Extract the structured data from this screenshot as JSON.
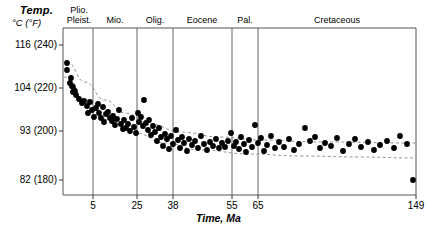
{
  "figure": {
    "y_axis_title": "Temp.",
    "y_axis_units": "°C  (°F)",
    "x_axis_title": "Time, Ma"
  },
  "chart_data": {
    "type": "scatter",
    "title": "Temp.",
    "subtitle": "°C  (°F)",
    "xlabel": "Time, Ma",
    "ylabel": "°C  (°F)",
    "grid": false,
    "legend": "none",
    "xlim": [
      0,
      149
    ],
    "ylim": [
      82,
      116
    ],
    "x_scale": "piecewise-geologic",
    "xticks": [
      {
        "value": 5,
        "label": "5",
        "px": 93
      },
      {
        "value": 25,
        "label": "25",
        "px": 137
      },
      {
        "value": 38,
        "label": "38",
        "px": 173
      },
      {
        "value": 55,
        "label": "55",
        "px": 232
      },
      {
        "value": 65,
        "label": "65",
        "px": 258
      },
      {
        "value": 149,
        "label": "149",
        "px": 416
      }
    ],
    "yticks": [
      {
        "celsius": 116,
        "fahrenheit": 240,
        "label": "116 (240)",
        "px": 45
      },
      {
        "celsius": 104,
        "fahrenheit": 220,
        "label": "104 (220)",
        "px": 88
      },
      {
        "celsius": 93,
        "fahrenheit": 200,
        "label": "93 (200)",
        "px": 131
      },
      {
        "celsius": 82,
        "fahrenheit": 180,
        "label": "82 (180)",
        "px": 180
      }
    ],
    "epochs": [
      {
        "name": "Plio.\nPleist.",
        "label_lines": [
          "Plio.",
          "Pleist."
        ],
        "x_start": 63,
        "x_end": 93,
        "center": 79
      },
      {
        "name": "Mio.",
        "label_lines": [
          "Mio."
        ],
        "x_start": 93,
        "x_end": 137,
        "center": 115
      },
      {
        "name": "Olig.",
        "label_lines": [
          "Olig."
        ],
        "x_start": 137,
        "x_end": 173,
        "center": 155
      },
      {
        "name": "Eocene",
        "label_lines": [
          "Eocene"
        ],
        "x_start": 173,
        "x_end": 232,
        "center": 202
      },
      {
        "name": "Pal.",
        "label_lines": [
          "Pal."
        ],
        "x_start": 232,
        "x_end": 258,
        "center": 245
      },
      {
        "name": "Cretaceous",
        "label_lines": [
          "Cretaceous"
        ],
        "x_start": 258,
        "x_end": 416,
        "center": 337
      }
    ],
    "points_px": [
      [
        67,
        63
      ],
      [
        67,
        70
      ],
      [
        71,
        78
      ],
      [
        70,
        83
      ],
      [
        72,
        86
      ],
      [
        73,
        87
      ],
      [
        73,
        92
      ],
      [
        75,
        91
      ],
      [
        76,
        95
      ],
      [
        79,
        99
      ],
      [
        82,
        103
      ],
      [
        84,
        101
      ],
      [
        87,
        106
      ],
      [
        88,
        113
      ],
      [
        90,
        102
      ],
      [
        92,
        110
      ],
      [
        94,
        117
      ],
      [
        96,
        108
      ],
      [
        98,
        104
      ],
      [
        99,
        113
      ],
      [
        101,
        118
      ],
      [
        103,
        107
      ],
      [
        104,
        122
      ],
      [
        106,
        114
      ],
      [
        108,
        112
      ],
      [
        110,
        118
      ],
      [
        112,
        121
      ],
      [
        113,
        116
      ],
      [
        115,
        125
      ],
      [
        117,
        119
      ],
      [
        119,
        110
      ],
      [
        121,
        124
      ],
      [
        123,
        129
      ],
      [
        124,
        120
      ],
      [
        126,
        128
      ],
      [
        128,
        124
      ],
      [
        130,
        131
      ],
      [
        132,
        118
      ],
      [
        134,
        127
      ],
      [
        136,
        133
      ],
      [
        138,
        113
      ],
      [
        139,
        122
      ],
      [
        141,
        117
      ],
      [
        143,
        126
      ],
      [
        144,
        100
      ],
      [
        146,
        123
      ],
      [
        148,
        130
      ],
      [
        149,
        120
      ],
      [
        151,
        135
      ],
      [
        153,
        126
      ],
      [
        155,
        132
      ],
      [
        157,
        141
      ],
      [
        159,
        128
      ],
      [
        161,
        137
      ],
      [
        163,
        146
      ],
      [
        165,
        134
      ],
      [
        167,
        139
      ],
      [
        169,
        149
      ],
      [
        171,
        136
      ],
      [
        173,
        144
      ],
      [
        176,
        130
      ],
      [
        178,
        140
      ],
      [
        180,
        148
      ],
      [
        182,
        137
      ],
      [
        184,
        143
      ],
      [
        187,
        151
      ],
      [
        189,
        139
      ],
      [
        192,
        145
      ],
      [
        195,
        141
      ],
      [
        198,
        148
      ],
      [
        201,
        136
      ],
      [
        204,
        144
      ],
      [
        207,
        150
      ],
      [
        210,
        142
      ],
      [
        213,
        146
      ],
      [
        216,
        139
      ],
      [
        219,
        148
      ],
      [
        222,
        143
      ],
      [
        225,
        147
      ],
      [
        228,
        141
      ],
      [
        231,
        133
      ],
      [
        234,
        146
      ],
      [
        236,
        142
      ],
      [
        239,
        149
      ],
      [
        241,
        137
      ],
      [
        244,
        144
      ],
      [
        246,
        152
      ],
      [
        249,
        140
      ],
      [
        252,
        147
      ],
      [
        255,
        125
      ],
      [
        258,
        143
      ],
      [
        261,
        138
      ],
      [
        264,
        151
      ],
      [
        267,
        145
      ],
      [
        271,
        136
      ],
      [
        275,
        148
      ],
      [
        279,
        142
      ],
      [
        284,
        147
      ],
      [
        289,
        139
      ],
      [
        294,
        150
      ],
      [
        299,
        144
      ],
      [
        305,
        128
      ],
      [
        310,
        141
      ],
      [
        315,
        137
      ],
      [
        320,
        148
      ],
      [
        325,
        143
      ],
      [
        331,
        146
      ],
      [
        337,
        138
      ],
      [
        343,
        151
      ],
      [
        349,
        144
      ],
      [
        355,
        139
      ],
      [
        361,
        147
      ],
      [
        368,
        142
      ],
      [
        374,
        150
      ],
      [
        380,
        145
      ],
      [
        387,
        141
      ],
      [
        394,
        148
      ],
      [
        400,
        136
      ],
      [
        407,
        144
      ],
      [
        413,
        180
      ]
    ],
    "envelope_curves": [
      {
        "name": "upper-trend",
        "style": "dashed",
        "path_px": [
          [
            67,
            62
          ],
          [
            85,
            82
          ],
          [
            105,
            100
          ],
          [
            125,
            113
          ],
          [
            150,
            124
          ],
          [
            180,
            132
          ],
          [
            220,
            137
          ],
          [
            260,
            140
          ],
          [
            320,
            142
          ],
          [
            416,
            143
          ]
        ]
      },
      {
        "name": "lower-trend",
        "style": "dashed",
        "path_px": [
          [
            64,
            77
          ],
          [
            85,
            100
          ],
          [
            110,
            120
          ],
          [
            135,
            133
          ],
          [
            165,
            143
          ],
          [
            200,
            150
          ],
          [
            250,
            154
          ],
          [
            300,
            156
          ],
          [
            360,
            157
          ],
          [
            416,
            158
          ]
        ]
      }
    ]
  }
}
